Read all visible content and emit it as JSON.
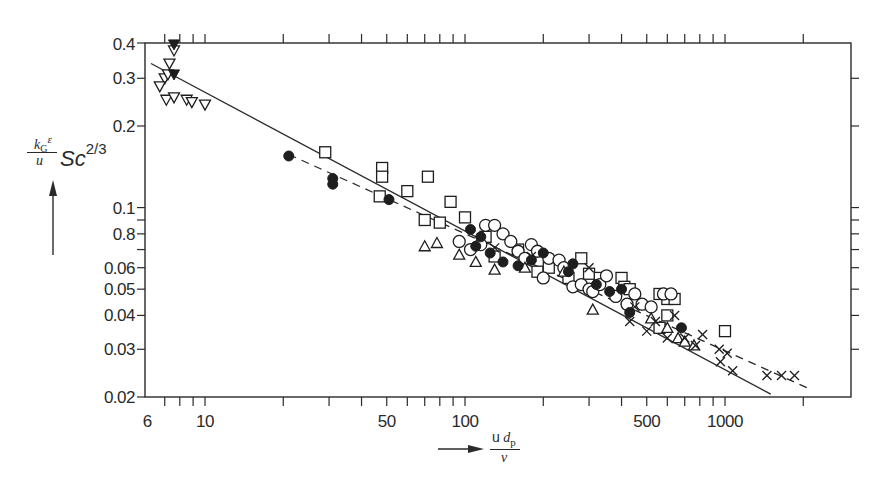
{
  "chart_data": {
    "type": "scatter",
    "title": "",
    "xlabel": "u d_p / ν",
    "ylabel": "(k_G ε / u) Sc^(2/3)",
    "xscale": "log",
    "yscale": "log",
    "xlim": [
      6,
      2800
    ],
    "ylim": [
      0.02,
      0.4
    ],
    "x_tick_labels": [
      "6",
      "10",
      "50",
      "100",
      "500",
      "1000"
    ],
    "x_tick_values": [
      6,
      10,
      50,
      100,
      500,
      1000
    ],
    "y_tick_labels": [
      "0.4",
      "0.3",
      "0.2",
      "0.1",
      "0.8",
      "0.06",
      "0.05",
      "0.04",
      "0.03",
      "0.02"
    ],
    "y_tick_values": [
      0.4,
      0.3,
      0.2,
      0.1,
      0.08,
      0.06,
      0.05,
      0.04,
      0.03,
      0.02
    ],
    "grid": false,
    "legend": null,
    "lines": [
      {
        "name": "solid fit",
        "style": "solid",
        "points": [
          [
            6.2,
            0.34
          ],
          [
            1500,
            0.0205
          ]
        ]
      },
      {
        "name": "dashed fit",
        "style": "dashed",
        "points": [
          [
            21,
            0.157
          ],
          [
            2100,
            0.0215
          ]
        ]
      }
    ],
    "series": [
      {
        "name": "open down-triangle",
        "marker": "triangle-down-open",
        "points": [
          [
            7.6,
            0.38
          ],
          [
            7.3,
            0.34
          ],
          [
            7.0,
            0.3
          ],
          [
            7.2,
            0.31
          ],
          [
            6.7,
            0.28
          ],
          [
            7.1,
            0.25
          ],
          [
            7.6,
            0.255
          ],
          [
            8.5,
            0.25
          ],
          [
            8.9,
            0.245
          ],
          [
            10.0,
            0.24
          ]
        ]
      },
      {
        "name": "filled down-triangle",
        "marker": "triangle-down-filled",
        "points": [
          [
            7.6,
            0.4
          ],
          [
            7.6,
            0.31
          ]
        ]
      },
      {
        "name": "filled circle",
        "marker": "circle-filled",
        "points": [
          [
            21,
            0.155
          ],
          [
            31,
            0.128
          ],
          [
            31,
            0.122
          ],
          [
            51,
            0.107
          ],
          [
            105,
            0.083
          ],
          [
            115,
            0.078
          ],
          [
            110,
            0.072
          ],
          [
            125,
            0.068
          ],
          [
            140,
            0.063
          ],
          [
            160,
            0.061
          ],
          [
            180,
            0.064
          ],
          [
            200,
            0.068
          ],
          [
            250,
            0.058
          ],
          [
            260,
            0.062
          ],
          [
            320,
            0.052
          ],
          [
            360,
            0.049
          ],
          [
            430,
            0.041
          ],
          [
            400,
            0.05
          ],
          [
            680,
            0.036
          ]
        ]
      },
      {
        "name": "open square",
        "marker": "square-open",
        "points": [
          [
            29,
            0.16
          ],
          [
            48,
            0.14
          ],
          [
            48,
            0.13
          ],
          [
            47,
            0.11
          ],
          [
            60,
            0.115
          ],
          [
            72,
            0.13
          ],
          [
            88,
            0.105
          ],
          [
            80,
            0.088
          ],
          [
            70,
            0.09
          ],
          [
            100,
            0.092
          ],
          [
            120,
            0.078
          ],
          [
            130,
            0.066
          ],
          [
            160,
            0.07
          ],
          [
            190,
            0.058
          ],
          [
            210,
            0.06
          ],
          [
            250,
            0.055
          ],
          [
            280,
            0.065
          ],
          [
            300,
            0.057
          ],
          [
            330,
            0.055
          ],
          [
            400,
            0.055
          ],
          [
            410,
            0.051
          ],
          [
            430,
            0.05
          ],
          [
            560,
            0.048
          ],
          [
            600,
            0.046
          ],
          [
            640,
            0.046
          ],
          [
            560,
            0.036
          ],
          [
            600,
            0.04
          ],
          [
            1000,
            0.035
          ]
        ]
      },
      {
        "name": "open circle",
        "marker": "circle-open",
        "points": [
          [
            95,
            0.075
          ],
          [
            105,
            0.07
          ],
          [
            115,
            0.073
          ],
          [
            120,
            0.086
          ],
          [
            130,
            0.086
          ],
          [
            140,
            0.08
          ],
          [
            150,
            0.075
          ],
          [
            160,
            0.069
          ],
          [
            170,
            0.065
          ],
          [
            180,
            0.073
          ],
          [
            190,
            0.069
          ],
          [
            200,
            0.055
          ],
          [
            210,
            0.065
          ],
          [
            230,
            0.064
          ],
          [
            240,
            0.06
          ],
          [
            260,
            0.051
          ],
          [
            280,
            0.052
          ],
          [
            300,
            0.05
          ],
          [
            310,
            0.049
          ],
          [
            330,
            0.052
          ],
          [
            350,
            0.056
          ],
          [
            380,
            0.047
          ],
          [
            420,
            0.044
          ],
          [
            450,
            0.048
          ],
          [
            480,
            0.044
          ],
          [
            520,
            0.043
          ],
          [
            580,
            0.048
          ],
          [
            620,
            0.048
          ]
        ]
      },
      {
        "name": "open triangle",
        "marker": "triangle-up-open",
        "points": [
          [
            70,
            0.072
          ],
          [
            78,
            0.074
          ],
          [
            95,
            0.067
          ],
          [
            110,
            0.063
          ],
          [
            130,
            0.059
          ],
          [
            170,
            0.06
          ],
          [
            240,
            0.058
          ],
          [
            310,
            0.042
          ],
          [
            520,
            0.039
          ],
          [
            600,
            0.036
          ],
          [
            660,
            0.033
          ],
          [
            700,
            0.032
          ],
          [
            760,
            0.031
          ]
        ]
      },
      {
        "name": "cross",
        "marker": "x",
        "points": [
          [
            130,
            0.071
          ],
          [
            180,
            0.066
          ],
          [
            300,
            0.06
          ],
          [
            430,
            0.038
          ],
          [
            450,
            0.043
          ],
          [
            500,
            0.035
          ],
          [
            540,
            0.038
          ],
          [
            600,
            0.033
          ],
          [
            640,
            0.04
          ],
          [
            700,
            0.033
          ],
          [
            770,
            0.031
          ],
          [
            820,
            0.034
          ],
          [
            950,
            0.03
          ],
          [
            960,
            0.027
          ],
          [
            1020,
            0.029
          ],
          [
            1070,
            0.025
          ],
          [
            1450,
            0.024
          ],
          [
            1650,
            0.024
          ],
          [
            1850,
            0.024
          ]
        ]
      }
    ]
  },
  "axis": {
    "y_title_numerator": "k",
    "y_title_numerator_sub": "G",
    "y_title_numerator_eps": "ε",
    "y_title_denominator": "u",
    "y_title_sc": "Sc",
    "y_title_exp": "2/3",
    "x_title_numerator_u": "u",
    "x_title_numerator_d": "d",
    "x_title_numerator_sub": "p",
    "x_title_denominator": "ν"
  }
}
